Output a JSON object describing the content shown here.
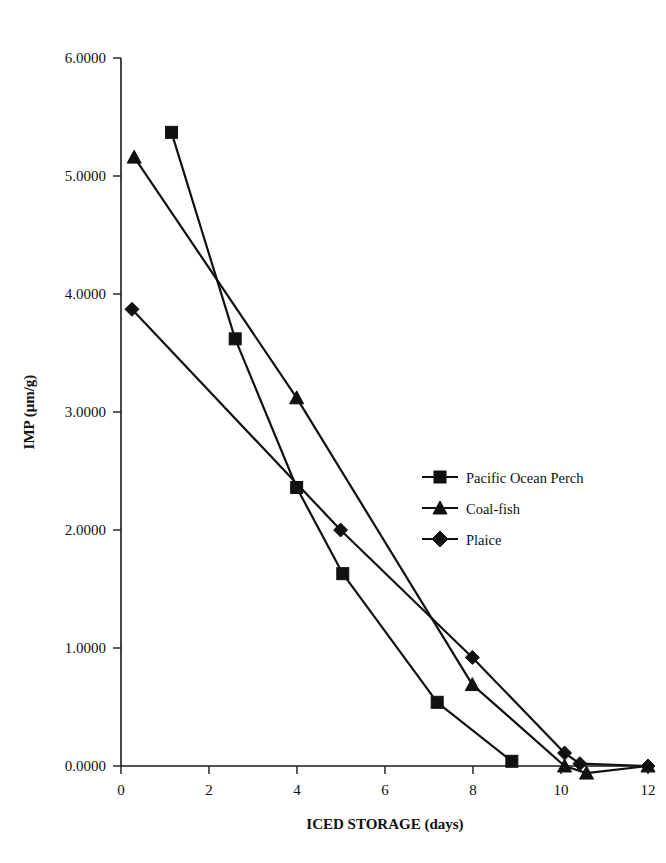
{
  "chart_data": {
    "type": "line",
    "title": "",
    "xlabel": "ICED STORAGE (days)",
    "ylabel": "IMP (μm/g)",
    "xlim": [
      0,
      12
    ],
    "ylim": [
      0,
      6
    ],
    "xticks": [
      "0",
      "2",
      "4",
      "6",
      "8",
      "10",
      "12"
    ],
    "xtick_values": [
      0,
      2,
      4,
      6,
      8,
      10,
      12
    ],
    "yticks": [
      "0.0000",
      "1.0000",
      "2.0000",
      "3.0000",
      "4.0000",
      "5.0000",
      "6.0000"
    ],
    "ytick_values": [
      0,
      1,
      2,
      3,
      4,
      5,
      6
    ],
    "grid": false,
    "legend_position": "center-right",
    "series": [
      {
        "name": "Pacific Ocean Perch",
        "marker": "square",
        "x": [
          1.15,
          2.6,
          4.0,
          5.05,
          7.2,
          8.9
        ],
        "y": [
          5.37,
          3.62,
          2.36,
          1.63,
          0.54,
          0.04
        ]
      },
      {
        "name": "Coal-fish",
        "marker": "triangle",
        "x": [
          0.3,
          4.0,
          8.0,
          10.1,
          10.6,
          12.0
        ],
        "y": [
          5.16,
          3.12,
          0.69,
          0.0,
          -0.06,
          0.0
        ]
      },
      {
        "name": "Plaice",
        "marker": "diamond",
        "x": [
          0.25,
          5.0,
          8.0,
          10.1,
          10.45,
          12.0
        ],
        "y": [
          3.87,
          2.0,
          0.92,
          0.11,
          0.02,
          0.0
        ]
      }
    ]
  }
}
